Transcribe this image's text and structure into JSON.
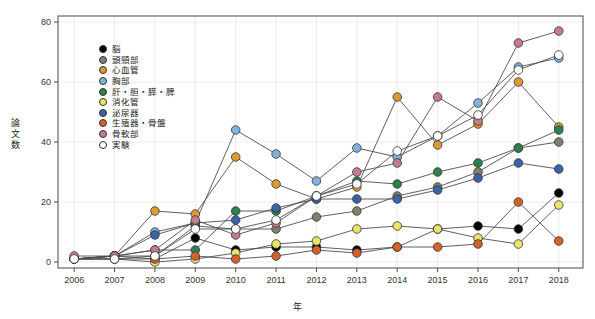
{
  "chart_data": {
    "type": "line",
    "title": "",
    "xlabel": "年",
    "ylabel": "論文数",
    "x": [
      2006,
      2007,
      2008,
      2009,
      2010,
      2011,
      2012,
      2013,
      2014,
      2015,
      2016,
      2017,
      2018
    ],
    "xlim": [
      2005.6,
      2018.6
    ],
    "ylim": [
      -2,
      82
    ],
    "yticks": [
      0,
      20,
      40,
      60,
      80
    ],
    "xticks": [
      "2006",
      "2007",
      "2008",
      "2009",
      "2010",
      "2011",
      "2012",
      "2013",
      "2014",
      "2015",
      "2016",
      "2017",
      "2018"
    ],
    "grid": true,
    "legend_position": "upper-left-inside",
    "marker": "circle",
    "marker_edge_color": "#333333",
    "line_color": "#4d4d4d",
    "series": [
      {
        "name": "脳",
        "color": "#000000",
        "values": [
          1,
          1,
          1,
          8,
          4,
          5,
          5,
          4,
          5,
          11,
          12,
          11,
          23
        ]
      },
      {
        "name": "頭頸部",
        "color": "#7f7f6e",
        "values": [
          1,
          2,
          2,
          12,
          11,
          11,
          15,
          17,
          22,
          25,
          30,
          38,
          40
        ]
      },
      {
        "name": "心血管",
        "color": "#dd9933",
        "values": [
          1,
          2,
          17,
          16,
          35,
          26,
          21,
          25,
          55,
          39,
          46,
          60,
          45
        ]
      },
      {
        "name": "胸部",
        "color": "#7fb2dd",
        "values": [
          1,
          2,
          10,
          13,
          44,
          36,
          27,
          38,
          35,
          42,
          53,
          65,
          68
        ]
      },
      {
        "name": "肝・胆・膵・脾",
        "color": "#2f7f4f",
        "values": [
          1,
          2,
          4,
          4,
          17,
          17,
          22,
          27,
          26,
          30,
          33,
          38,
          44
        ]
      },
      {
        "name": "消化管",
        "color": "#e8e36a",
        "values": [
          1,
          1,
          0,
          1,
          3,
          6,
          7,
          11,
          12,
          11,
          8,
          6,
          19
        ]
      },
      {
        "name": "泌尿器",
        "color": "#3a62a8",
        "values": [
          1,
          2,
          9,
          13,
          14,
          18,
          21,
          21,
          21,
          24,
          28,
          33,
          31
        ]
      },
      {
        "name": "生殖器・骨盤",
        "color": "#d4602a",
        "values": [
          1,
          2,
          1,
          2,
          1,
          2,
          4,
          3,
          5,
          5,
          6,
          20,
          7
        ]
      },
      {
        "name": "骨軟部",
        "color": "#c47b8e",
        "values": [
          2,
          2,
          4,
          14,
          9,
          13,
          22,
          30,
          33,
          55,
          47,
          73,
          77
        ]
      },
      {
        "name": "実験",
        "color": "#ffffff",
        "values": [
          1,
          1,
          2,
          11,
          11,
          14,
          22,
          26,
          37,
          42,
          49,
          64,
          69
        ]
      }
    ]
  }
}
